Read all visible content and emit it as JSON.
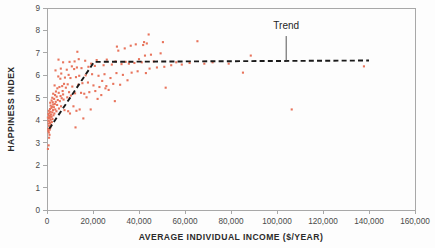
{
  "chart_data": {
    "type": "scatter",
    "title": "",
    "xlabel": "AVERAGE INDIVIDUAL INCOME ($/YEAR)",
    "ylabel": "HAPPINESS INDEX",
    "xlim": [
      0,
      160000
    ],
    "ylim": [
      0,
      9
    ],
    "xticks": [
      0,
      20000,
      40000,
      60000,
      80000,
      100000,
      120000,
      140000,
      160000
    ],
    "xticklabels": [
      "0",
      "20,000",
      "40,000",
      "60,000",
      "80,000",
      "100,000",
      "120,000",
      "140,000",
      "160,000"
    ],
    "yticks": [
      0,
      1,
      2,
      3,
      4,
      5,
      6,
      7,
      8,
      9
    ],
    "yticklabels": [
      "0",
      "1",
      "2",
      "3",
      "4",
      "5",
      "6",
      "7",
      "8",
      "9"
    ],
    "grid": false,
    "legend": null,
    "point_color": "#e8745c",
    "point_size": 2.1,
    "annotations": [
      {
        "label": "Trend",
        "text_x": 104000,
        "text_y": 8.05,
        "leader_from_y": 7.75,
        "leader_to_y": 6.66
      }
    ],
    "series": [
      {
        "name": "Countries",
        "marker": "square",
        "color": "#e8745c",
        "points": [
          [
            400,
            2.72
          ],
          [
            700,
            2.88
          ],
          [
            900,
            3.22
          ],
          [
            1100,
            3.35
          ],
          [
            800,
            3.45
          ],
          [
            600,
            3.52
          ],
          [
            1200,
            3.58
          ],
          [
            500,
            3.62
          ],
          [
            1500,
            3.68
          ],
          [
            900,
            3.75
          ],
          [
            1800,
            3.8
          ],
          [
            700,
            3.85
          ],
          [
            1300,
            3.88
          ],
          [
            2100,
            3.92
          ],
          [
            1000,
            3.95
          ],
          [
            600,
            3.98
          ],
          [
            1600,
            4.02
          ],
          [
            2400,
            4.05
          ],
          [
            800,
            4.08
          ],
          [
            1200,
            4.1
          ],
          [
            400,
            4.12
          ],
          [
            2000,
            4.15
          ],
          [
            1400,
            4.18
          ],
          [
            900,
            4.2
          ],
          [
            2800,
            4.22
          ],
          [
            1700,
            4.25
          ],
          [
            600,
            4.28
          ],
          [
            3200,
            4.3
          ],
          [
            1100,
            4.32
          ],
          [
            2300,
            4.35
          ],
          [
            1500,
            4.38
          ],
          [
            4100,
            4.4
          ],
          [
            800,
            4.42
          ],
          [
            2600,
            4.45
          ],
          [
            3600,
            4.48
          ],
          [
            1300,
            4.5
          ],
          [
            5200,
            4.52
          ],
          [
            1900,
            4.55
          ],
          [
            3000,
            4.58
          ],
          [
            2200,
            4.6
          ],
          [
            6100,
            4.62
          ],
          [
            1600,
            4.65
          ],
          [
            4400,
            4.68
          ],
          [
            2700,
            4.7
          ],
          [
            3400,
            4.72
          ],
          [
            7600,
            4.45
          ],
          [
            9200,
            4.4
          ],
          [
            12800,
            4.42
          ],
          [
            14200,
            4.48
          ],
          [
            11500,
            4.62
          ],
          [
            1400,
            4.78
          ],
          [
            2500,
            4.8
          ],
          [
            3800,
            4.82
          ],
          [
            5600,
            4.85
          ],
          [
            2000,
            4.88
          ],
          [
            4700,
            4.9
          ],
          [
            7200,
            4.92
          ],
          [
            3100,
            4.95
          ],
          [
            6400,
            4.98
          ],
          [
            2300,
            5.0
          ],
          [
            8800,
            5.02
          ],
          [
            4200,
            5.05
          ],
          [
            5900,
            5.08
          ],
          [
            10400,
            5.1
          ],
          [
            3500,
            5.12
          ],
          [
            7000,
            5.15
          ],
          [
            2700,
            5.18
          ],
          [
            12200,
            5.2
          ],
          [
            5100,
            5.22
          ],
          [
            9600,
            5.25
          ],
          [
            3900,
            5.28
          ],
          [
            6800,
            5.3
          ],
          [
            14800,
            5.22
          ],
          [
            16200,
            5.18
          ],
          [
            18400,
            5.25
          ],
          [
            21000,
            5.3
          ],
          [
            23600,
            5.12
          ],
          [
            26800,
            5.35
          ],
          [
            29500,
            4.85
          ],
          [
            31800,
            5.58
          ],
          [
            4500,
            5.42
          ],
          [
            8200,
            5.45
          ],
          [
            5400,
            5.48
          ],
          [
            11000,
            5.5
          ],
          [
            6600,
            5.52
          ],
          [
            3300,
            5.55
          ],
          [
            13600,
            5.58
          ],
          [
            9000,
            5.6
          ],
          [
            7400,
            5.62
          ],
          [
            15400,
            5.65
          ],
          [
            17800,
            5.68
          ],
          [
            20200,
            5.55
          ],
          [
            22800,
            5.48
          ],
          [
            25400,
            5.42
          ],
          [
            24000,
            5.75
          ],
          [
            5800,
            5.85
          ],
          [
            10200,
            5.88
          ],
          [
            7800,
            5.9
          ],
          [
            12600,
            5.92
          ],
          [
            4900,
            5.95
          ],
          [
            14000,
            5.98
          ],
          [
            16800,
            6.0
          ],
          [
            9400,
            6.02
          ],
          [
            19600,
            6.05
          ],
          [
            6200,
            6.08
          ],
          [
            22400,
            5.98
          ],
          [
            25000,
            6.05
          ],
          [
            27600,
            5.88
          ],
          [
            30200,
            6.1
          ],
          [
            33000,
            6.02
          ],
          [
            3700,
            6.22
          ],
          [
            8600,
            6.25
          ],
          [
            11800,
            6.28
          ],
          [
            6000,
            6.3
          ],
          [
            15000,
            6.32
          ],
          [
            13000,
            6.35
          ],
          [
            18000,
            6.38
          ],
          [
            10800,
            6.4
          ],
          [
            20800,
            6.42
          ],
          [
            24600,
            6.45
          ],
          [
            28200,
            6.48
          ],
          [
            32400,
            6.5
          ],
          [
            35600,
            6.52
          ],
          [
            38000,
            6.55
          ],
          [
            41200,
            6.58
          ],
          [
            44600,
            6.3
          ],
          [
            47800,
            6.35
          ],
          [
            51000,
            6.38
          ],
          [
            36800,
            6.12
          ],
          [
            43000,
            6.1
          ],
          [
            7000,
            6.58
          ],
          [
            9800,
            6.6
          ],
          [
            12000,
            6.62
          ],
          [
            16600,
            6.65
          ],
          [
            19200,
            6.52
          ],
          [
            5000,
            6.7
          ],
          [
            13800,
            6.72
          ],
          [
            21600,
            6.68
          ],
          [
            26000,
            6.7
          ],
          [
            29800,
            6.62
          ],
          [
            34200,
            6.6
          ],
          [
            40000,
            6.72
          ],
          [
            42600,
            6.88
          ],
          [
            45200,
            6.92
          ],
          [
            49400,
            6.98
          ],
          [
            56200,
            6.58
          ],
          [
            62000,
            6.55
          ],
          [
            68400,
            6.52
          ],
          [
            72000,
            6.58
          ],
          [
            88600,
            6.88
          ],
          [
            13200,
            7.05
          ],
          [
            31000,
            7.1
          ],
          [
            33800,
            7.2
          ],
          [
            30400,
            7.28
          ],
          [
            36400,
            7.32
          ],
          [
            38600,
            7.38
          ],
          [
            41800,
            7.35
          ],
          [
            43400,
            7.42
          ],
          [
            42200,
            7.48
          ],
          [
            50400,
            7.48
          ],
          [
            65400,
            7.52
          ],
          [
            44200,
            7.82
          ],
          [
            51600,
            5.45
          ],
          [
            85200,
            6.12
          ],
          [
            106400,
            4.48
          ],
          [
            137800,
            6.4
          ],
          [
            12400,
            3.68
          ],
          [
            15800,
            4.08
          ],
          [
            19000,
            4.48
          ],
          [
            10000,
            4.3
          ],
          [
            22000,
            4.95
          ],
          [
            17200,
            5.02
          ],
          [
            25800,
            5.52
          ],
          [
            28800,
            5.62
          ],
          [
            35000,
            5.78
          ],
          [
            39400,
            6.18
          ],
          [
            46400,
            6.62
          ],
          [
            54000,
            6.45
          ],
          [
            58600,
            6.48
          ],
          [
            79000,
            6.52
          ]
        ]
      }
    ],
    "trend": {
      "label": "Trend",
      "style": "dashed",
      "color": "#1a1a1a",
      "points": [
        [
          1000,
          3.62
        ],
        [
          20500,
          6.6
        ],
        [
          140000,
          6.66
        ]
      ]
    }
  }
}
